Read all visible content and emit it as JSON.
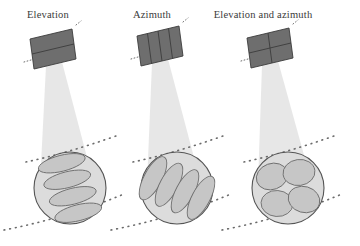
{
  "figure": {
    "type": "diagram",
    "background_color": "#ffffff",
    "panel_count": 3
  },
  "colors": {
    "array_fill": "#6e6e6e",
    "array_fill_dark": "#5f5f5f",
    "array_stroke": "#3c3c3c",
    "beam_fill": "#e3e3e3",
    "circle_fill": "#dcdcdc",
    "circle_stroke": "#555555",
    "spot_fill": "#c6c6c6",
    "spot_stroke": "#6f6f6f",
    "dash_color": "#6a6a6a",
    "label_color": "#3a3a3a"
  },
  "panels": [
    {
      "id": "elevation",
      "label": "Elevation",
      "label_x": 48,
      "label_y": 18,
      "array": {
        "name": "antenna-array-elevation",
        "split": "horizontal",
        "rows": 2,
        "columns": 1,
        "divider_count": 1
      },
      "beam": {
        "name": "beam-cone-elevation"
      },
      "footprint": {
        "name": "beam-footprint-elevation",
        "cx": 70,
        "cy": 188,
        "r": 36,
        "spot_shape": "elongated-horizontal",
        "spot_count": 4,
        "spot_rx": 24,
        "spot_ry": 8,
        "spot_rotation_deg": -14
      }
    },
    {
      "id": "azimuth",
      "label": "Azimuth",
      "label_x": 152,
      "label_y": 18,
      "array": {
        "name": "antenna-array-azimuth",
        "split": "vertical",
        "rows": 1,
        "columns": 4,
        "divider_count": 3
      },
      "beam": {
        "name": "beam-cone-azimuth"
      },
      "footprint": {
        "name": "beam-footprint-azimuth",
        "cx": 177,
        "cy": 188,
        "r": 36,
        "spot_shape": "elongated-diagonal",
        "spot_count": 4,
        "spot_rx": 24,
        "spot_ry": 9,
        "spot_rotation_deg": -62
      }
    },
    {
      "id": "elevation-and-azimuth",
      "label": "Elevation and azimuth",
      "label_x": 263,
      "label_y": 18,
      "array": {
        "name": "antenna-array-elevation-azimuth",
        "split": "grid",
        "rows": 2,
        "columns": 2,
        "divider_count": 2
      },
      "beam": {
        "name": "beam-cone-elevation-azimuth"
      },
      "footprint": {
        "name": "beam-footprint-elevation-azimuth",
        "cx": 288,
        "cy": 188,
        "r": 36,
        "spot_shape": "compact-round",
        "spot_count": 4,
        "spot_rx": 16,
        "spot_ry": 13,
        "spot_rotation_deg": -20
      }
    }
  ],
  "ground_lines": {
    "name": "ground-contour-dashed-lines",
    "style": "dotted",
    "per_panel": 2
  }
}
